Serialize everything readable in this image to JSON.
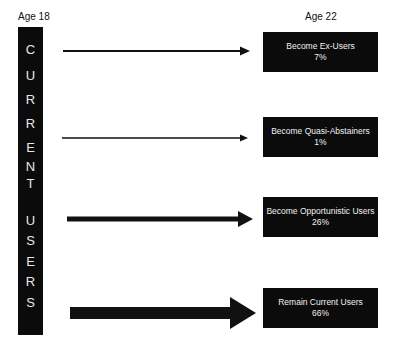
{
  "headers": {
    "left": "Age 18",
    "right": "Age 22"
  },
  "source_group": {
    "label": "CURRENT USERS",
    "letters": [
      "C",
      "U",
      "R",
      "R",
      "E",
      "N",
      "T",
      "",
      "U",
      "S",
      "E",
      "R",
      "S"
    ]
  },
  "outcomes": [
    {
      "label": "Become Ex-Users",
      "percent": "7%"
    },
    {
      "label": "Become Quasi-Abstainers",
      "percent": "1%"
    },
    {
      "label": "Become Opportunistic Users",
      "percent": "26%"
    },
    {
      "label": "Remain Current Users",
      "percent": "66%"
    }
  ],
  "colors": {
    "box": "#0b0b0b",
    "box_text": "#f0f0f0",
    "arrow": "#111111",
    "background": "#ffffff"
  }
}
